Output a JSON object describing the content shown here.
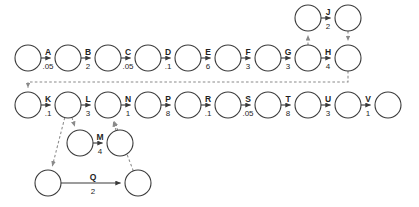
{
  "diagram": {
    "node_radius": 13,
    "colors": {
      "background": "#ffffff",
      "node_stroke": "#3a3a3a",
      "node_fill": "#ffffff",
      "solid_edge": "#3a3a3a",
      "dashed_edge": "#8a8a8a",
      "label_text": "#1f1f1f"
    },
    "nodes": [
      {
        "id": "n1",
        "cx": 28,
        "cy": 58,
        "name": "node-row1-1"
      },
      {
        "id": "n2",
        "cx": 68,
        "cy": 58,
        "name": "node-row1-2"
      },
      {
        "id": "n3",
        "cx": 108,
        "cy": 58,
        "name": "node-row1-3"
      },
      {
        "id": "n4",
        "cx": 148,
        "cy": 58,
        "name": "node-row1-4"
      },
      {
        "id": "n5",
        "cx": 188,
        "cy": 58,
        "name": "node-row1-5"
      },
      {
        "id": "n6",
        "cx": 228,
        "cy": 58,
        "name": "node-row1-6"
      },
      {
        "id": "n7",
        "cx": 268,
        "cy": 58,
        "name": "node-row1-7"
      },
      {
        "id": "n8",
        "cx": 308,
        "cy": 58,
        "name": "node-row1-8"
      },
      {
        "id": "n9",
        "cx": 348,
        "cy": 58,
        "name": "node-row1-9"
      },
      {
        "id": "j1",
        "cx": 308,
        "cy": 18,
        "name": "node-top-j-source"
      },
      {
        "id": "j2",
        "cx": 348,
        "cy": 18,
        "name": "node-top-j-target"
      },
      {
        "id": "m1",
        "cx": 28,
        "cy": 105,
        "name": "node-row2-1"
      },
      {
        "id": "m2",
        "cx": 68,
        "cy": 105,
        "name": "node-row2-2"
      },
      {
        "id": "m3",
        "cx": 108,
        "cy": 105,
        "name": "node-row2-3"
      },
      {
        "id": "m4",
        "cx": 148,
        "cy": 105,
        "name": "node-row2-4"
      },
      {
        "id": "m5",
        "cx": 188,
        "cy": 105,
        "name": "node-row2-5"
      },
      {
        "id": "m6",
        "cx": 228,
        "cy": 105,
        "name": "node-row2-6"
      },
      {
        "id": "m7",
        "cx": 268,
        "cy": 105,
        "name": "node-row2-7"
      },
      {
        "id": "m8",
        "cx": 308,
        "cy": 105,
        "name": "node-row2-8"
      },
      {
        "id": "m9",
        "cx": 348,
        "cy": 105,
        "name": "node-row2-9"
      },
      {
        "id": "m10",
        "cx": 388,
        "cy": 105,
        "name": "node-row2-10"
      },
      {
        "id": "q1",
        "cx": 80,
        "cy": 143,
        "name": "node-row3-m-source"
      },
      {
        "id": "q2",
        "cx": 120,
        "cy": 143,
        "name": "node-row3-m-target"
      },
      {
        "id": "r1",
        "cx": 48,
        "cy": 183,
        "name": "node-row4-q-source"
      },
      {
        "id": "r2",
        "cx": 138,
        "cy": 183,
        "name": "node-row4-q-target"
      }
    ],
    "edges": [
      {
        "label": "A",
        "weight": ".05",
        "from": "n1",
        "to": "n2",
        "style": "solid",
        "name": "edge-a"
      },
      {
        "label": "B",
        "weight": "2",
        "from": "n2",
        "to": "n3",
        "style": "solid",
        "name": "edge-b"
      },
      {
        "label": "C",
        "weight": ".05",
        "from": "n3",
        "to": "n4",
        "style": "solid",
        "name": "edge-c"
      },
      {
        "label": "D",
        "weight": ".1",
        "from": "n4",
        "to": "n5",
        "style": "solid",
        "name": "edge-d"
      },
      {
        "label": "E",
        "weight": "6",
        "from": "n5",
        "to": "n6",
        "style": "solid",
        "name": "edge-e"
      },
      {
        "label": "F",
        "weight": "3",
        "from": "n6",
        "to": "n7",
        "style": "solid",
        "name": "edge-f"
      },
      {
        "label": "G",
        "weight": "3",
        "from": "n7",
        "to": "n8",
        "style": "solid",
        "name": "edge-g"
      },
      {
        "label": "H",
        "weight": "4",
        "from": "n8",
        "to": "n9",
        "style": "solid",
        "name": "edge-h"
      },
      {
        "label": "J",
        "weight": "2",
        "from": "j1",
        "to": "j2",
        "style": "solid",
        "name": "edge-j"
      },
      {
        "label": "K",
        "weight": ".1",
        "from": "m1",
        "to": "m2",
        "style": "solid",
        "name": "edge-k"
      },
      {
        "label": "L",
        "weight": "3",
        "from": "m2",
        "to": "m3",
        "style": "solid",
        "name": "edge-l"
      },
      {
        "label": "N",
        "weight": "1",
        "from": "m3",
        "to": "m4",
        "style": "solid",
        "name": "edge-n"
      },
      {
        "label": "P",
        "weight": "8",
        "from": "m4",
        "to": "m5",
        "style": "solid",
        "name": "edge-p"
      },
      {
        "label": "R",
        "weight": ".1",
        "from": "m5",
        "to": "m6",
        "style": "solid",
        "name": "edge-r"
      },
      {
        "label": "S",
        "weight": ".05",
        "from": "m6",
        "to": "m7",
        "style": "solid",
        "name": "edge-s"
      },
      {
        "label": "T",
        "weight": "8",
        "from": "m7",
        "to": "m8",
        "style": "solid",
        "name": "edge-t"
      },
      {
        "label": "U",
        "weight": "3",
        "from": "m8",
        "to": "m9",
        "style": "solid",
        "name": "edge-u"
      },
      {
        "label": "V",
        "weight": "1",
        "from": "m9",
        "to": "m10",
        "style": "solid",
        "name": "edge-v"
      },
      {
        "label": "M",
        "weight": "4",
        "from": "q1",
        "to": "q2",
        "style": "solid",
        "name": "edge-m"
      },
      {
        "label": "Q",
        "weight": "2",
        "from": "r1",
        "to": "r2",
        "style": "solid",
        "name": "edge-q"
      }
    ],
    "dashed_edges": [
      {
        "from": "n8",
        "to": "j1",
        "name": "dashed-edge-g-to-j-source"
      },
      {
        "from": "j2",
        "to": "n9",
        "name": "dashed-edge-j-target-to-h"
      },
      {
        "from": "n9",
        "to": "m1",
        "name": "dashed-edge-feedback-h-to-row2"
      },
      {
        "from": "m2",
        "to": "q1",
        "name": "dashed-edge-row2-to-m-source"
      },
      {
        "from": "m2",
        "to": "r1",
        "name": "dashed-edge-row2-to-q-source"
      },
      {
        "from": "q2",
        "to": "m3",
        "name": "dashed-edge-m-target-to-row2"
      },
      {
        "from": "r2",
        "to": "m3",
        "name": "dashed-edge-q-target-to-row2"
      }
    ]
  }
}
